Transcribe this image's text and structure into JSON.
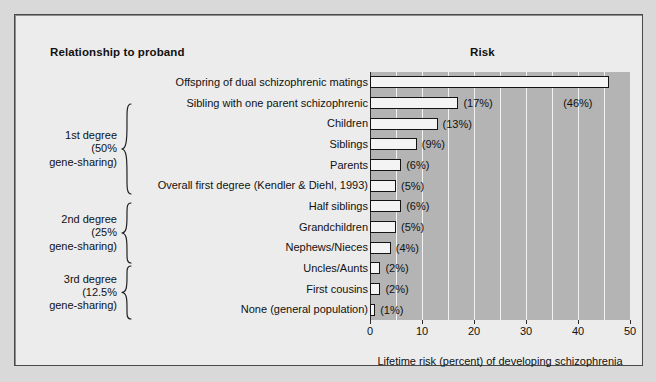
{
  "headers": {
    "left": "Relationship to proband",
    "right": "Risk"
  },
  "groups": [
    {
      "id": "first-degree",
      "lines": [
        "1st degree",
        "(50%",
        "gene-sharing)"
      ],
      "top": 88,
      "height": 92
    },
    {
      "id": "second-degree",
      "lines": [
        "2nd degree",
        "(25%",
        "gene-sharing)"
      ],
      "top": 187,
      "height": 62
    },
    {
      "id": "third-degree",
      "lines": [
        "3rd degree",
        "(12.5%",
        "gene-sharing)"
      ],
      "top": 250,
      "height": 55
    }
  ],
  "chart_data": {
    "type": "bar",
    "orientation": "horizontal",
    "title": "Risk",
    "xlabel": "Lifetime risk (percent) of developing schizophrenia",
    "ylabel": "Relationship to proband",
    "xlim": [
      0,
      50
    ],
    "xticks": [
      0,
      10,
      20,
      30,
      40,
      50
    ],
    "xticklabels": [
      "0",
      "10",
      "20",
      "30",
      "40",
      "50"
    ],
    "minor_gridlines": [
      5,
      10,
      15,
      20,
      25,
      30,
      35,
      40,
      45
    ],
    "grid": true,
    "legend": "none",
    "categories": [
      "Offspring of dual schizophrenic matings",
      "Sibling with one parent schizophrenic",
      "Children",
      "Siblings",
      "Parents",
      "Overall first degree (Kendler & Diehl, 1993)",
      "Half siblings",
      "Grandchildren",
      "Nephews/Nieces",
      "Uncles/Aunts",
      "First cousins",
      "None (general population)"
    ],
    "values": [
      46,
      17,
      13,
      9,
      6,
      5,
      6,
      5,
      4,
      2,
      2,
      1
    ],
    "value_labels": [
      "(46%)",
      "(17%)",
      "(13%)",
      "(9%)",
      "(6%)",
      "(5%)",
      "(6%)",
      "(5%)",
      "(4%)",
      "(2%)",
      "(2%)",
      "(1%)"
    ],
    "colors": {
      "bar_fill": "#f4f4f4",
      "bar_edge": "#141414",
      "plot_background": "#b4b4b4",
      "gridline": "#f2f2f2",
      "figure_background": "#ececec",
      "text": "#111111"
    }
  }
}
